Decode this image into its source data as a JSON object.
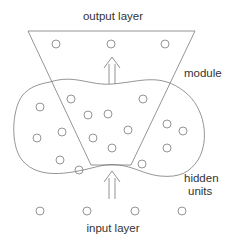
{
  "diagram": {
    "labels": {
      "output_layer": "output layer",
      "module": "module",
      "hidden_units_line1": "hidden",
      "hidden_units_line2": "units",
      "input_layer": "input layer"
    },
    "colors": {
      "stroke": "#7a7a7a",
      "text": "#333333",
      "background": "#ffffff"
    },
    "output_nodes": [
      {
        "x": 56,
        "y": 44
      },
      {
        "x": 111,
        "y": 44
      },
      {
        "x": 165,
        "y": 44
      }
    ],
    "hidden_nodes": [
      {
        "x": 40,
        "y": 107
      },
      {
        "x": 71,
        "y": 99
      },
      {
        "x": 88,
        "y": 115
      },
      {
        "x": 108,
        "y": 114
      },
      {
        "x": 143,
        "y": 99
      },
      {
        "x": 62,
        "y": 132
      },
      {
        "x": 37,
        "y": 138
      },
      {
        "x": 93,
        "y": 138
      },
      {
        "x": 128,
        "y": 130
      },
      {
        "x": 167,
        "y": 124
      },
      {
        "x": 183,
        "y": 131
      },
      {
        "x": 112,
        "y": 148
      },
      {
        "x": 167,
        "y": 148
      },
      {
        "x": 60,
        "y": 160
      },
      {
        "x": 79,
        "y": 170
      },
      {
        "x": 142,
        "y": 164
      }
    ],
    "input_nodes": [
      {
        "x": 40,
        "y": 211
      },
      {
        "x": 87,
        "y": 211
      },
      {
        "x": 135,
        "y": 211
      },
      {
        "x": 182,
        "y": 211
      }
    ]
  }
}
